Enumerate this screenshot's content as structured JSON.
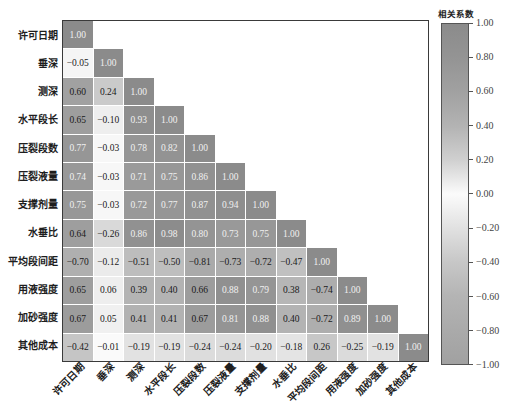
{
  "chart_data": {
    "type": "heatmap",
    "title": "",
    "xlabel": "",
    "ylabel": "",
    "grid": false,
    "legend_position": "right (colorbar)",
    "triangle": "lower",
    "variables": [
      "许可日期",
      "垂深",
      "测深",
      "水平段长",
      "压裂段数",
      "压裂液量",
      "支撑剂量",
      "水垂比",
      "平均段间距",
      "用液强度",
      "加砂强度",
      "其他成本"
    ],
    "matrix_lower_triangle": [
      [
        1.0
      ],
      [
        -0.05,
        1.0
      ],
      [
        0.6,
        0.24,
        1.0
      ],
      [
        0.65,
        -0.1,
        0.93,
        1.0
      ],
      [
        0.77,
        -0.03,
        0.78,
        0.82,
        1.0
      ],
      [
        0.74,
        -0.03,
        0.71,
        0.75,
        0.86,
        1.0
      ],
      [
        0.75,
        -0.03,
        0.72,
        0.77,
        0.87,
        0.94,
        1.0
      ],
      [
        0.64,
        -0.26,
        0.86,
        0.98,
        0.8,
        0.73,
        0.75,
        1.0
      ],
      [
        -0.7,
        -0.12,
        -0.51,
        -0.5,
        -0.81,
        -0.73,
        -0.72,
        -0.47,
        1.0
      ],
      [
        0.65,
        0.06,
        0.39,
        0.4,
        0.66,
        0.88,
        0.79,
        0.38,
        -0.74,
        1.0
      ],
      [
        0.67,
        0.05,
        0.41,
        0.41,
        0.67,
        0.81,
        0.88,
        0.4,
        -0.72,
        0.89,
        1.0
      ],
      [
        -0.42,
        -0.01,
        -0.19,
        -0.19,
        -0.24,
        -0.24,
        -0.2,
        -0.18,
        0.26,
        -0.25,
        -0.19,
        1.0
      ]
    ],
    "colorbar": {
      "label": "相关系数",
      "range": [
        -1.0,
        1.0
      ],
      "tick_values": [
        1.0,
        0.8,
        0.6,
        0.4,
        0.2,
        0.0,
        -0.2,
        -0.4,
        -0.6,
        -0.8,
        -1.0
      ],
      "tick_labels": [
        "1.00",
        "0.80",
        "0.60",
        "0.40",
        "0.20",
        "0.00",
        "−0.20",
        "−0.40",
        "−0.60",
        "−0.80",
        "−1.00"
      ]
    },
    "colormap": [
      {
        "v": 1.0,
        "c": "#8b8b8b"
      },
      {
        "v": 0.8,
        "c": "#949494"
      },
      {
        "v": 0.6,
        "c": "#a1a1a1"
      },
      {
        "v": 0.4,
        "c": "#b3b3b3"
      },
      {
        "v": 0.2,
        "c": "#d0d0d0"
      },
      {
        "v": 0.0,
        "c": "#fbfbfb"
      },
      {
        "v": -0.2,
        "c": "#e1e1e1"
      },
      {
        "v": -0.4,
        "c": "#c7c7c7"
      },
      {
        "v": -0.6,
        "c": "#b4b4b4"
      },
      {
        "v": -0.8,
        "c": "#aaaaaa"
      },
      {
        "v": -1.0,
        "c": "#a1a1a1"
      }
    ],
    "light_text_threshold": 0.7,
    "light_text_color": "#f0f0f0",
    "dark_text_color": "#1a1a1a"
  }
}
